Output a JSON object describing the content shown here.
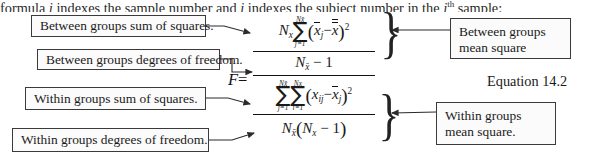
{
  "document": {
    "caption": {
      "prefix": "formula ",
      "var_j": "j",
      "mid1": " indexes the sample number and ",
      "var_i": "i",
      "mid2": " indexes the subject number in the ",
      "var_j2": "j",
      "superscript": "th",
      "suffix": " sample:"
    },
    "equation_label": "Equation 14.2"
  },
  "callouts": {
    "between_groups_sum_of_squares": "Between groups sum of squares.",
    "between_groups_degrees_of_freedom": "Between groups degrees of freedom.",
    "within_groups_sum_of_squares": "Within groups sum of squares.",
    "within_groups_degrees_of_freedom": "Within groups degrees of freedom.",
    "between_groups_mean_square_line1": "Between groups",
    "between_groups_mean_square_line2": "mean square",
    "within_groups_mean_square_line1": "Within groups",
    "within_groups_mean_square_line2": "mean square."
  },
  "equation": {
    "lhs": "F",
    "equals": "=",
    "numerator": {
      "coefficient_symbol": "N",
      "coefficient_subscript": "x",
      "sigma_upper_symbol": "N",
      "sigma_upper_subscript": "x̄",
      "sigma_lower": "j=1",
      "open_paren": "(",
      "term1": "x̄",
      "term1_subscript": "j",
      "minus": "−",
      "term2": "x̿",
      "close_paren": ")",
      "power": "2",
      "denominator_symbol": "N",
      "denominator_subscript": "x̄",
      "denominator_minus_one": "− 1"
    },
    "denominator": {
      "sigma1_upper_symbol": "N",
      "sigma1_upper_subscript": "x̄",
      "sigma1_lower": "j=1",
      "sigma2_upper_symbol": "N",
      "sigma2_upper_subscript": "x",
      "sigma2_lower": "i=1",
      "open_paren": "(",
      "term1": "x",
      "term1_subscript": "ij",
      "minus": "−",
      "term2": "x̄",
      "term2_subscript": "j",
      "close_paren": ")",
      "power": "2",
      "den_symbol1": "N",
      "den_sub1": "x̄",
      "den_open": "(",
      "den_symbol2": "N",
      "den_sub2": "x",
      "den_minus_one": "− 1",
      "den_close": ")"
    },
    "brace_glyph": "}"
  },
  "colors": {
    "box_border": "#3a3a3a",
    "box_fill": "#fbfbfb",
    "text": "#1a1a1a",
    "wire": "#2b2b2b",
    "page_background": "#ffffff"
  }
}
